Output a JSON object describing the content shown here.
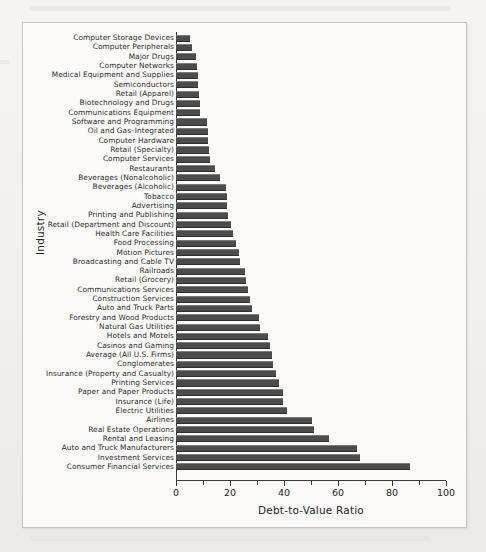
{
  "chart_data": {
    "type": "bar",
    "orientation": "horizontal",
    "title": "",
    "xlabel": "Debt-to-Value Ratio",
    "ylabel": "Industry",
    "xlim": [
      0,
      100
    ],
    "xticks": [
      0,
      20,
      40,
      60,
      80,
      100
    ],
    "xtick_labels": [
      "0",
      "20",
      "40",
      "60",
      "80",
      "100"
    ],
    "minor_ticks": [
      10,
      30,
      50,
      70,
      90
    ],
    "grid": false,
    "legend": null,
    "bar_color": "#4c4c4c",
    "categories": [
      "Computer Storage Devices",
      "Computer Peripherals",
      "Major Drugs",
      "Computer Networks",
      "Medical Equipment and Supplies",
      "Semiconductors",
      "Retail (Apparel)",
      "Biotechnology and Drugs",
      "Communications Equipment",
      "Software and Programming",
      "Oil and Gas–Integrated",
      "Computer Hardware",
      "Retail (Specialty)",
      "Computer Services",
      "Restaurants",
      "Beverages (Nonalcoholic)",
      "Beverages (Alcoholic)",
      "Tobacco",
      "Advertising",
      "Printing and Publishing",
      "Retail (Department and Discount)",
      "Health Care Facilities",
      "Food Processing",
      "Motion Pictures",
      "Broadcasting and Cable TV",
      "Railroads",
      "Retail (Grocery)",
      "Communications Services",
      "Construction Services",
      "Auto and Truck Parts",
      "Forestry and Wood Products",
      "Natural Gas Utilities",
      "Hotels and Motels",
      "Casinos and Gaming",
      "Average (All U.S. Firms)",
      "Conglomerates",
      "Insurance (Property and Casualty)",
      "Printing Services",
      "Paper and Paper Products",
      "Insurance (Life)",
      "Electric Utilities",
      "Airlines",
      "Real Estate Operations",
      "Rental and Leasing",
      "Auto and Truck Manufacturers",
      "Investment Services",
      "Consumer Financial Services"
    ],
    "values": [
      5.0,
      5.8,
      7.5,
      7.8,
      8.0,
      8.2,
      8.6,
      8.8,
      9.0,
      11.5,
      11.8,
      12.0,
      12.3,
      12.5,
      14.5,
      16.3,
      18.6,
      18.8,
      19.0,
      19.4,
      20.5,
      21.0,
      22.4,
      23.5,
      23.7,
      25.6,
      26.0,
      26.8,
      27.5,
      28.2,
      30.8,
      31.0,
      34.0,
      34.8,
      35.6,
      35.8,
      37.2,
      38.0,
      39.6,
      39.8,
      41.2,
      50.5,
      51.2,
      56.6,
      67.0,
      68.0,
      86.5
    ]
  }
}
